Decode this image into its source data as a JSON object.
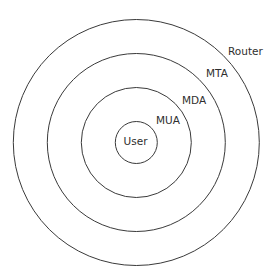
{
  "diagram": {
    "type": "concentric-circles",
    "center": {
      "x": 136.3,
      "y": 142.5
    },
    "line_color": "#3a3a3a",
    "text_color": "#2e2e2e",
    "layers": [
      {
        "label": "User",
        "radius": 21,
        "label_x": 135.5,
        "label_y": 145,
        "anchor": "middle"
      },
      {
        "label": "MUA",
        "radius": 55,
        "label_x": 156,
        "label_y": 124,
        "anchor": "start"
      },
      {
        "label": "MDA",
        "radius": 89,
        "label_x": 182,
        "label_y": 104,
        "anchor": "start"
      },
      {
        "label": "MTA",
        "radius": 89,
        "label_x": 206,
        "label_y": 77,
        "anchor": "start"
      },
      {
        "label": "Router",
        "radius": 123,
        "label_x": 228,
        "label_y": 55,
        "anchor": "start"
      }
    ],
    "rings": [
      21,
      55,
      89,
      123
    ]
  }
}
